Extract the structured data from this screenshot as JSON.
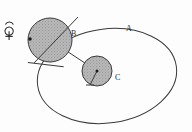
{
  "figure": {
    "labels": {
      "orbit": "A",
      "large_body": "B",
      "small_body": "C"
    },
    "symbols": {
      "mercury": "mercury-symbol"
    },
    "colors": {
      "stroke": "#3a3a3a",
      "fill": "#b4b4b4",
      "background": "#fdfdfd",
      "text": "#2b2b2b"
    },
    "geometry": {
      "ellipse": {
        "cx": 107,
        "cy": 76,
        "rx": 70,
        "ry": 47,
        "rotation": -8
      },
      "circle_b": {
        "cx": 50,
        "cy": 40,
        "r": 22
      },
      "circle_c": {
        "cx": 97,
        "cy": 71,
        "r": 15
      },
      "connector": {
        "x1": 50,
        "y1": 40,
        "x2": 97,
        "y2": 71
      },
      "marker_dot": {
        "cx": 30,
        "cy": 39,
        "r": 1.8
      }
    }
  }
}
